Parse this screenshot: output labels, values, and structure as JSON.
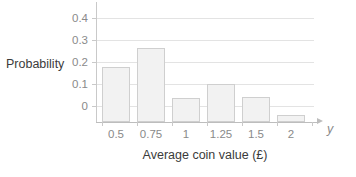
{
  "chart_data": {
    "type": "bar",
    "title": "",
    "subtitle": "",
    "xlabel": "Average coin value (£)",
    "ylabel": "Probability",
    "variable_symbol": "y",
    "categories": [
      "0.5",
      "0.75",
      "1",
      "1.25",
      "1.5",
      "2"
    ],
    "values": [
      0.25,
      0.335,
      0.11,
      0.175,
      0.115,
      0.03
    ],
    "ylim": [
      0,
      0.45
    ],
    "ytick_labels": [
      "0",
      "0.1",
      "0.2",
      "0.3",
      "0.4"
    ],
    "ytick_values": [
      0,
      0.1,
      0.2,
      0.3,
      0.4
    ],
    "grid": "horizontal",
    "legend": "none",
    "series": [
      {
        "name": "Probability",
        "values": [
          0.25,
          0.335,
          0.11,
          0.175,
          0.115,
          0.03
        ]
      }
    ]
  },
  "style": {
    "bar_fill": "#f2f2f2",
    "bar_stroke": "#cfcfcf",
    "gridline_color": "#e3e3e3",
    "axis_color": "#bdbdbd",
    "tick_label_color": "#8a8a8a",
    "title_color": "#3b3b3b",
    "background": "#ffffff"
  }
}
